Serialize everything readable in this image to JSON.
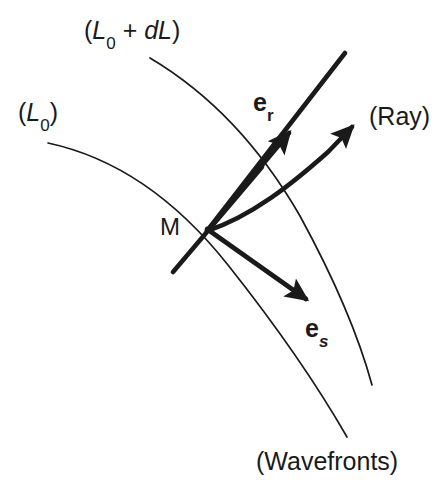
{
  "figure": {
    "background_color": "#ffffff",
    "stroke_color": "#1a1a1a",
    "thin_stroke_width": 1.6,
    "thick_stroke_width": 5.0,
    "labels": {
      "wavefront_inner": {
        "text_open_paren": "(",
        "text_L": "L",
        "text_sub": "0",
        "text_close_paren": ")",
        "full": "(L0)",
        "x": 18,
        "y": 100
      },
      "wavefront_outer": {
        "text_open_paren": "(",
        "text_L": "L",
        "text_sub": "0",
        "text_plus": " + ",
        "text_dL": "dL",
        "text_close_paren": ")",
        "full": "(L0 + dL)",
        "x": 84,
        "y": 18
      },
      "point_m": {
        "text": "M",
        "x": 160,
        "y": 215
      },
      "vector_er": {
        "symbol": "e",
        "subscript": "r",
        "full": "er",
        "x": 253,
        "y": 90
      },
      "vector_es": {
        "symbol": "e",
        "subscript": "s",
        "full": "es",
        "x": 305,
        "y": 316
      },
      "ray": {
        "text": "(Ray)",
        "x": 369,
        "y": 104
      },
      "wavefronts": {
        "text": "(Wavefronts)",
        "x": 256,
        "y": 449
      }
    },
    "geometry": {
      "wavefront_inner_path": "M 48 143 C 120 160 180 200 230 265 C 280 330 320 390 347 437",
      "wavefront_outer_path": "M 150 58 C 215 95 262 148 300 215 C 338 282 360 340 372 385",
      "tangent_line": {
        "x1": 173,
        "y1": 272,
        "x2": 262,
        "y2": 168
      },
      "ray_straight_line": {
        "x1": 207,
        "y1": 230,
        "x2": 345,
        "y2": 53
      },
      "arrow_er": {
        "x1": 207,
        "y1": 230,
        "x2": 293,
        "y2": 128
      },
      "arrow_es": {
        "x1": 207,
        "y1": 228,
        "x2": 312,
        "y2": 305
      },
      "arrow_ray_path": "M 207 230 C 250 215 290 180 330 145 L 358 122",
      "point_m_marker": {
        "cx": 207,
        "cy": 229
      }
    }
  }
}
